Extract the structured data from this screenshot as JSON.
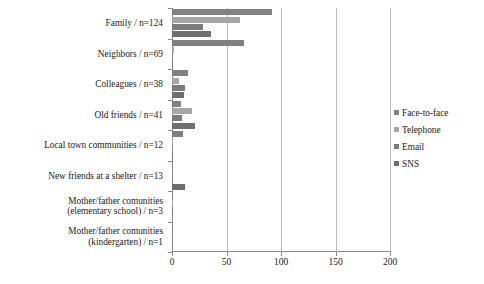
{
  "chart_data": {
    "type": "bar",
    "orientation": "horizontal",
    "title": "",
    "xlabel": "",
    "ylabel": "",
    "xlim": [
      0,
      200
    ],
    "xticks": [
      0,
      50,
      100,
      150,
      200
    ],
    "xtick_labels": [
      "0",
      "50",
      "100",
      "150",
      "200"
    ],
    "grid": true,
    "grid_axis": "x",
    "legend_position": "right",
    "categories": [
      "Family / n=124",
      "Neighbors / n=69",
      "Colleagues / n=38",
      "Old friends / n=41",
      "Local town communities / n=12",
      "New friends at a shelter / n=13",
      "Mother/father comunities\n(elementary school) / n=3",
      "Mother/father comunities\n(kindergarten) / n=1"
    ],
    "series": [
      {
        "name": "Face-to-face",
        "color": "#808080",
        "values": [
          92,
          66,
          15,
          8,
          10,
          1,
          1,
          1
        ]
      },
      {
        "name": "Telephone",
        "color": "#a6a6a6",
        "values": [
          62,
          2,
          6,
          18,
          1,
          0,
          1,
          0
        ]
      },
      {
        "name": "Email",
        "color": "#7b7b7b",
        "values": [
          28,
          0,
          12,
          9,
          0,
          0,
          1,
          1
        ]
      },
      {
        "name": "SNS",
        "color": "#6e6e6e",
        "values": [
          36,
          1,
          11,
          21,
          1,
          12,
          0,
          0
        ]
      }
    ]
  }
}
